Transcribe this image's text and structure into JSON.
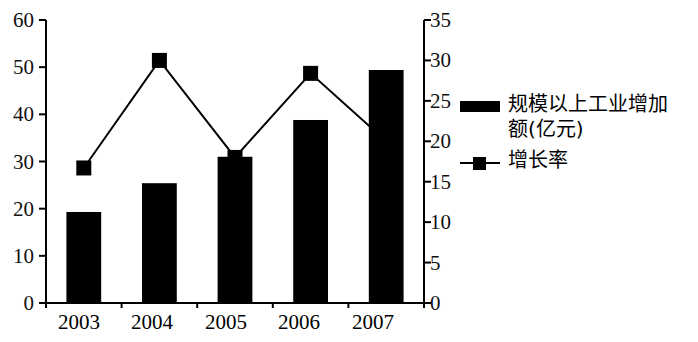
{
  "chart_data": {
    "type": "bar",
    "title": "",
    "subtitle": "",
    "xlabel": "",
    "ylabel": "",
    "categories": [
      "2003",
      "2004",
      "2005",
      "2006",
      "2007"
    ],
    "grid": false,
    "legend_position": "right",
    "axes": {
      "left": {
        "name": "规模以上工业增加额(亿元)",
        "min": 0,
        "max": 60,
        "tick_step": 10,
        "ticks": [
          "0",
          "10",
          "20",
          "30",
          "40",
          "50",
          "60"
        ]
      },
      "right": {
        "name": "增长率",
        "min": 0,
        "max": 35,
        "tick_step": 5,
        "ticks": [
          "0",
          "5",
          "10",
          "15",
          "20",
          "25",
          "30",
          "35"
        ]
      }
    },
    "series": [
      {
        "name": "规模以上工业增加额(亿元)",
        "type": "bar",
        "axis": "left",
        "color": "#000000",
        "values": [
          19.3,
          25.4,
          31.0,
          38.8,
          49.4
        ]
      },
      {
        "name": "增长率",
        "type": "line",
        "axis": "right",
        "color": "#000000",
        "marker": "square",
        "values": [
          16.7,
          30.0,
          18.0,
          28.4,
          20.0
        ]
      }
    ]
  },
  "legend": {
    "items": [
      {
        "key_type": "bar-swatch",
        "label": "规模以上工业增加\n额(亿元)",
        "label_line1": "规模以上工业增加",
        "label_line2": "额(亿元)"
      },
      {
        "key_type": "line-marker-swatch",
        "label": "增长率"
      }
    ]
  }
}
